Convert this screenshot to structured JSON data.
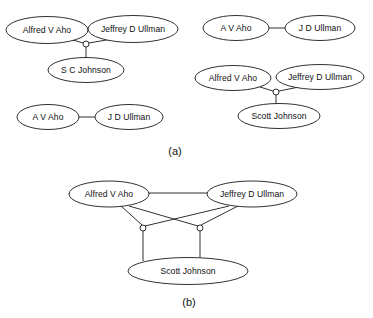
{
  "figure": {
    "width": 373,
    "height": 318,
    "background_color": "#ffffff",
    "line_color": "#1a1a1a",
    "text_color": "#111111",
    "type": "entity-relationship-diagram"
  },
  "panels": [
    {
      "id": "panel-a",
      "caption": "(a)",
      "caption_x": 175,
      "caption_y": 152,
      "groups": [
        {
          "id": "group-a1",
          "nodes": [
            {
              "id": "a1-aho",
              "label": "Alfred V Aho",
              "cx": 47,
              "cy": 30,
              "rx": 41,
              "ry": 13.5
            },
            {
              "id": "a1-ullman",
              "label": "Jeffrey D Ullman",
              "cx": 133,
              "cy": 29,
              "rx": 45,
              "ry": 13.5
            },
            {
              "id": "a1-johnson",
              "label": "S C Johnson",
              "cx": 86,
              "cy": 70,
              "rx": 38,
              "ry": 12.5
            }
          ],
          "junctions": [
            {
              "id": "a1-j",
              "cx": 86,
              "cy": 44,
              "r": 3
            }
          ],
          "edges": [
            {
              "from": "a1-aho",
              "to": "a1-j",
              "x1": 73,
              "y1": 40,
              "x2": 83,
              "y2": 43
            },
            {
              "from": "a1-ullman",
              "to": "a1-j",
              "x1": 112,
              "y1": 39,
              "x2": 89,
              "y2": 43
            },
            {
              "from": "a1-j",
              "to": "a1-johnson",
              "x1": 86,
              "y1": 47,
              "x2": 86,
              "y2": 58
            }
          ]
        },
        {
          "id": "group-a2",
          "nodes": [
            {
              "id": "a2-aho",
              "label": "A V Aho",
              "cx": 48,
              "cy": 117,
              "rx": 31,
              "ry": 12.5
            },
            {
              "id": "a2-ullman",
              "label": "J D Ullman",
              "cx": 129,
              "cy": 117,
              "rx": 34,
              "ry": 12.5
            }
          ],
          "junctions": [],
          "edges": [
            {
              "from": "a2-aho",
              "to": "a2-ullman",
              "x1": 79,
              "y1": 117,
              "x2": 95,
              "y2": 117
            }
          ]
        },
        {
          "id": "group-a3",
          "nodes": [
            {
              "id": "a3-aho",
              "label": "A V Aho",
              "cx": 236,
              "cy": 28,
              "rx": 33,
              "ry": 12.5
            },
            {
              "id": "a3-ullman",
              "label": "J D Ullman",
              "cx": 320,
              "cy": 28,
              "rx": 35,
              "ry": 12.5
            }
          ],
          "junctions": [],
          "edges": [
            {
              "from": "a3-aho",
              "to": "a3-ullman",
              "x1": 269,
              "y1": 28,
              "x2": 285,
              "y2": 28
            }
          ]
        },
        {
          "id": "group-a4",
          "nodes": [
            {
              "id": "a4-aho",
              "label": "Alfred V Aho",
              "cx": 233,
              "cy": 78,
              "rx": 38,
              "ry": 12.5
            },
            {
              "id": "a4-ullman",
              "label": "Jeffrey D Ullman",
              "cx": 320,
              "cy": 77,
              "rx": 44,
              "ry": 12.5
            },
            {
              "id": "a4-johnson",
              "label": "Scott Johnson",
              "cx": 279,
              "cy": 116,
              "rx": 41,
              "ry": 12.5
            }
          ],
          "junctions": [
            {
              "id": "a4-j",
              "cx": 276,
              "cy": 92,
              "r": 3
            }
          ],
          "edges": [
            {
              "from": "a4-aho",
              "to": "a4-j",
              "x1": 260,
              "y1": 87,
              "x2": 273,
              "y2": 91
            },
            {
              "from": "a4-ullman",
              "to": "a4-j",
              "x1": 299,
              "y1": 87,
              "x2": 279,
              "y2": 91
            },
            {
              "from": "a4-j",
              "to": "a4-johnson",
              "x1": 276,
              "y1": 95,
              "x2": 276,
              "y2": 104
            }
          ]
        }
      ]
    },
    {
      "id": "panel-b",
      "caption": "(b)",
      "caption_x": 189,
      "caption_y": 303,
      "groups": [
        {
          "id": "group-b1",
          "nodes": [
            {
              "id": "b-aho",
              "label": "Alfred V Aho",
              "cx": 109,
              "cy": 194,
              "rx": 40,
              "ry": 13.0
            },
            {
              "id": "b-ullman",
              "label": "Jeffrey D Ullman",
              "cx": 252,
              "cy": 194,
              "rx": 45,
              "ry": 13.0
            },
            {
              "id": "b-johnson",
              "label": "Scott Johnson",
              "cx": 188,
              "cy": 271,
              "rx": 60,
              "ry": 13.5
            }
          ],
          "junctions": [
            {
              "id": "b-j-left",
              "cx": 143,
              "cy": 228,
              "r": 3
            },
            {
              "id": "b-j-right",
              "cx": 200,
              "cy": 228,
              "r": 3
            }
          ],
          "edges": [
            {
              "from": "b-aho",
              "to": "b-ullman",
              "x1": 149,
              "y1": 193,
              "x2": 207,
              "y2": 193
            },
            {
              "from": "b-aho",
              "to": "b-j-left",
              "x1": 121,
              "y1": 206,
              "x2": 142,
              "y2": 225
            },
            {
              "from": "b-ullman",
              "to": "b-j-left",
              "x1": 229,
              "y1": 206,
              "x2": 145,
              "y2": 226
            },
            {
              "from": "b-aho",
              "to": "b-j-right",
              "x1": 129,
              "y1": 206,
              "x2": 198,
              "y2": 226
            },
            {
              "from": "b-ullman",
              "to": "b-j-right",
              "x1": 238,
              "y1": 206,
              "x2": 201,
              "y2": 225
            },
            {
              "from": "b-j-left",
              "to": "b-johnson",
              "x1": 143,
              "y1": 231,
              "x2": 143,
              "y2": 261
            },
            {
              "from": "b-j-right",
              "to": "b-johnson",
              "x1": 200,
              "y1": 231,
              "x2": 200,
              "y2": 261
            }
          ]
        }
      ]
    }
  ]
}
